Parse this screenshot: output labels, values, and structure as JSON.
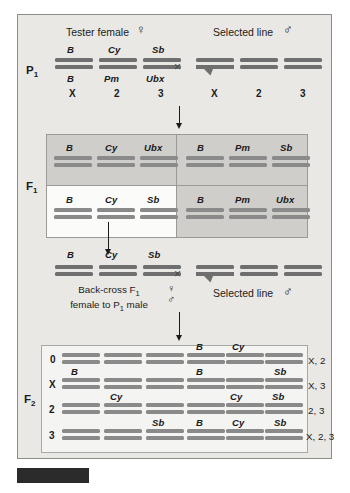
{
  "figure": {
    "symbols": {
      "female": "♀",
      "male": "♂",
      "cross": "×"
    }
  },
  "p1": {
    "generation_label": "P",
    "generation_sub": "1",
    "left_header": "Tester  female",
    "left_symbol": "♀",
    "right_header": "Selected line",
    "right_symbol": "♂",
    "cross_symbol": "×",
    "female_top_genes": [
      "B",
      "Cy",
      "Sb"
    ],
    "female_bottom_genes": [
      "B",
      "Pm",
      "Ubx"
    ],
    "female_chromosome_numbers": [
      "X",
      "2",
      "3"
    ],
    "male_chromosome_numbers": [
      "X",
      "2",
      "3"
    ]
  },
  "f1": {
    "generation_label": "F",
    "generation_sub": "1",
    "quadrants": [
      {
        "position": "top-left",
        "genes": [
          "B",
          "Cy",
          "Ubx"
        ],
        "highlighted": "false"
      },
      {
        "position": "top-right",
        "genes": [
          "B",
          "Pm",
          "Sb"
        ],
        "highlighted": "false"
      },
      {
        "position": "bottom-left",
        "genes": [
          "B",
          "Cy",
          "Sb"
        ],
        "highlighted": "true"
      },
      {
        "position": "bottom-right",
        "genes": [
          "B",
          "Pm",
          "Ubx"
        ],
        "highlighted": "false"
      }
    ]
  },
  "backcross": {
    "genes": [
      "B",
      "Cy",
      "Sb"
    ],
    "cross_symbol": "×",
    "note_line1": "Back-cross F",
    "note_line1_sub": "1",
    "note_line2_a": "female to P",
    "note_line2_sub": "1",
    "note_line2_b": " male",
    "female_symbol": "♀",
    "male_symbol": "♂",
    "right_header": "Selected line",
    "right_symbol": "♂"
  },
  "f2": {
    "generation_label": "F",
    "generation_sub": "2",
    "rows": [
      {
        "row_label": "0",
        "left_genes": [
          "",
          "",
          ""
        ],
        "right_genes": [
          "B",
          "Cy",
          ""
        ],
        "result": "X, 2"
      },
      {
        "row_label": "X",
        "left_genes": [
          "B",
          "",
          ""
        ],
        "right_genes": [
          "B",
          "",
          "Sb"
        ],
        "result": "X, 3"
      },
      {
        "row_label": "2",
        "left_genes": [
          "",
          "Cy",
          ""
        ],
        "right_genes": [
          "",
          "Cy",
          "Sb"
        ],
        "result": "2, 3"
      },
      {
        "row_label": "3",
        "left_genes": [
          "",
          "",
          "Sb"
        ],
        "right_genes": [
          "B",
          "Cy",
          "Sb"
        ],
        "result": "X, 2, 3"
      }
    ]
  },
  "colors": {
    "panel_background": "#e9e8e4",
    "chromosome_gray": "#7d7d7d",
    "quadrant_gray": "#cfcecb",
    "quadrant_white": "#fbfbfa",
    "f2_background": "#f4f4f2",
    "frame_border": "#8e8d89",
    "black_bar": "#2b2b2b"
  }
}
